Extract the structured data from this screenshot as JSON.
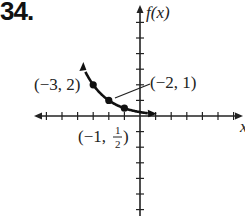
{
  "problem_number": "34.",
  "chart_data": {
    "type": "line",
    "title": "",
    "xlabel": "x",
    "ylabel": "f(x)",
    "function_description": "decreasing exponential curve through labeled points",
    "x": [
      -3,
      -2,
      -1
    ],
    "series": [
      {
        "name": "f(x)",
        "values": [
          2,
          1,
          0.5
        ]
      }
    ],
    "points": [
      {
        "label": "(−3, 2)",
        "x": -3,
        "y": 2
      },
      {
        "label": "(−2, 1)",
        "x": -2,
        "y": 1
      },
      {
        "label": "(−1, 1/2)",
        "x": -1,
        "y": 0.5
      }
    ],
    "curve_extent": {
      "x_start": -3.5,
      "x_end": 0.5
    },
    "xlim": [
      -6.5,
      6.5
    ],
    "ylim": [
      -6.5,
      7
    ],
    "grid": false,
    "tick_spacing": 1,
    "arrows": "curve arrow up-left and right; axes arrows"
  },
  "labels": {
    "fx": "f(x)",
    "x": "x",
    "p1": "(−3, 2)",
    "p2": "(−2, 1)",
    "p3_prefix": "(−1, ",
    "p3_num": "1",
    "p3_den": "2",
    "p3_suffix": ")"
  }
}
